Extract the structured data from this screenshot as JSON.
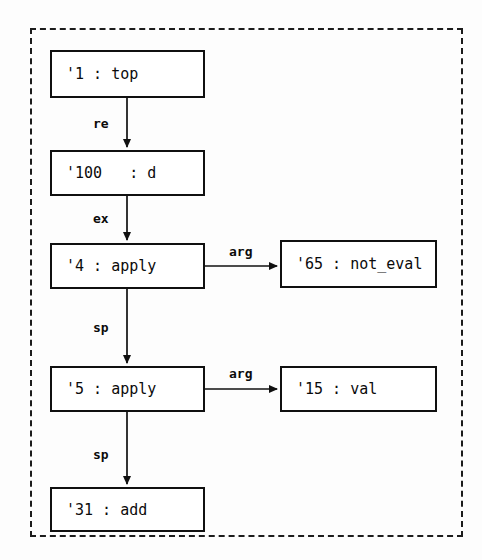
{
  "diagram": {
    "frame": {
      "style": "dashed"
    },
    "nodes": [
      {
        "id": "n1",
        "label": "'1 : top",
        "x": 50,
        "y": 50,
        "w": 155,
        "h": 48
      },
      {
        "id": "n100",
        "label": "'100   : d",
        "x": 50,
        "y": 150,
        "w": 155,
        "h": 46
      },
      {
        "id": "n4",
        "label": "'4 : apply",
        "x": 50,
        "y": 243,
        "w": 155,
        "h": 46
      },
      {
        "id": "n65",
        "label": "'65 : not_eval",
        "x": 280,
        "y": 240,
        "w": 157,
        "h": 48
      },
      {
        "id": "n5",
        "label": "'5 : apply",
        "x": 50,
        "y": 366,
        "w": 155,
        "h": 46
      },
      {
        "id": "n15",
        "label": "'15 : val",
        "x": 280,
        "y": 366,
        "w": 157,
        "h": 46
      },
      {
        "id": "n31",
        "label": "'31 : add",
        "x": 50,
        "y": 487,
        "w": 155,
        "h": 45
      }
    ],
    "edges": [
      {
        "id": "e1",
        "from": "n1",
        "to": "n100",
        "label": "re",
        "label_x": 93,
        "label_y": 116,
        "dir": "down"
      },
      {
        "id": "e2",
        "from": "n100",
        "to": "n4",
        "label": "ex",
        "label_x": 93,
        "label_y": 211,
        "dir": "down"
      },
      {
        "id": "e3",
        "from": "n4",
        "to": "n65",
        "label": "arg",
        "label_x": 229,
        "label_y": 244,
        "dir": "right"
      },
      {
        "id": "e4",
        "from": "n4",
        "to": "n5",
        "label": "sp",
        "label_x": 93,
        "label_y": 320,
        "dir": "down"
      },
      {
        "id": "e5",
        "from": "n5",
        "to": "n15",
        "label": "arg",
        "label_x": 229,
        "label_y": 366,
        "dir": "right"
      },
      {
        "id": "e6",
        "from": "n5",
        "to": "n31",
        "label": "sp",
        "label_x": 93,
        "label_y": 447,
        "dir": "down"
      }
    ],
    "colors": {
      "stroke": "#101010",
      "frame": "#1c1c1c",
      "text": "#0b0b0b",
      "background": "#fdfdfd"
    }
  }
}
